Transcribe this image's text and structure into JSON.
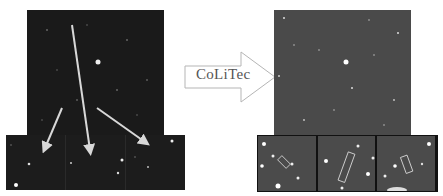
{
  "diagram": {
    "title": "",
    "process_label": "CoLiTec",
    "left": {
      "name": "original-frame",
      "background": "#1a1a1a",
      "insets": 3
    },
    "right": {
      "name": "processed-frame",
      "background": "#4a4a4a",
      "insets": 3,
      "highlight_boxes": 3
    },
    "colors": {
      "arrow": "#d8d8d8",
      "process_arrow_stroke": "#aaaaaa",
      "star": "#ffffff"
    }
  }
}
